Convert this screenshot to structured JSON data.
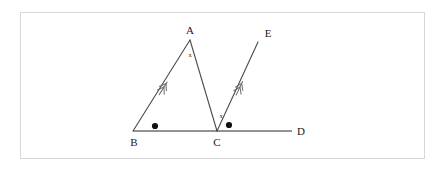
{
  "figure": {
    "kind": "geometry-diagram",
    "background_color": "#ffffff",
    "frame_color": "#d8d8d8",
    "line_color": "#4a4a4a",
    "baseline_color": "#6e6e6e",
    "mark_color": "#111111"
  },
  "points": [
    {
      "name": "A",
      "label": "A",
      "x": 190,
      "y": 40,
      "label_x": 188,
      "label_y": 34
    },
    {
      "name": "B",
      "label": "B",
      "x": 133,
      "y": 131,
      "label_x": 131,
      "label_y": 145
    },
    {
      "name": "C",
      "label": "C",
      "x": 217,
      "y": 131,
      "label_x": 215,
      "label_y": 145
    },
    {
      "name": "D",
      "label": "D",
      "x": 292,
      "y": 131,
      "label_x": 298,
      "label_y": 135
    },
    {
      "name": "E",
      "label": "E",
      "x": 258,
      "y": 42,
      "label_x": 266,
      "label_y": 36
    }
  ],
  "segments": [
    {
      "name": "segment-BA",
      "from": "B",
      "to": "A",
      "style": "thin"
    },
    {
      "name": "segment-AC",
      "from": "A",
      "to": "C",
      "style": "thin"
    },
    {
      "name": "segment-CE",
      "from": "C",
      "to": "E",
      "style": "thin"
    },
    {
      "name": "segment-BD",
      "from": "B",
      "to": "D",
      "style": "baseline"
    }
  ],
  "parallel_marks": [
    {
      "name": "parallel-mark-BA",
      "on": "segment-BA",
      "x": 164,
      "y": 87,
      "angle_deg": -58,
      "arrows": 2
    },
    {
      "name": "parallel-mark-CE",
      "on": "segment-CE",
      "x": 240,
      "y": 87,
      "angle_deg": -60,
      "arrows": 2
    }
  ],
  "angle_marks": [
    {
      "name": "angle-mark-A",
      "label": "x",
      "x": 190,
      "y": 57,
      "kind": "text"
    },
    {
      "name": "angle-mark-ACE",
      "label": "x",
      "x": 221,
      "y": 118,
      "kind": "text"
    },
    {
      "name": "angle-mark-ABC",
      "label": "•",
      "x": 155,
      "y": 126,
      "kind": "dot",
      "radius": 3.1
    },
    {
      "name": "angle-mark-ECD",
      "label": "•",
      "x": 229,
      "y": 125,
      "kind": "dot",
      "radius": 3.1
    }
  ],
  "labels": {
    "A": "A",
    "B": "B",
    "C": "C",
    "D": "D",
    "E": "E",
    "angle_x_apex": "x",
    "angle_x_at_c": "x"
  }
}
